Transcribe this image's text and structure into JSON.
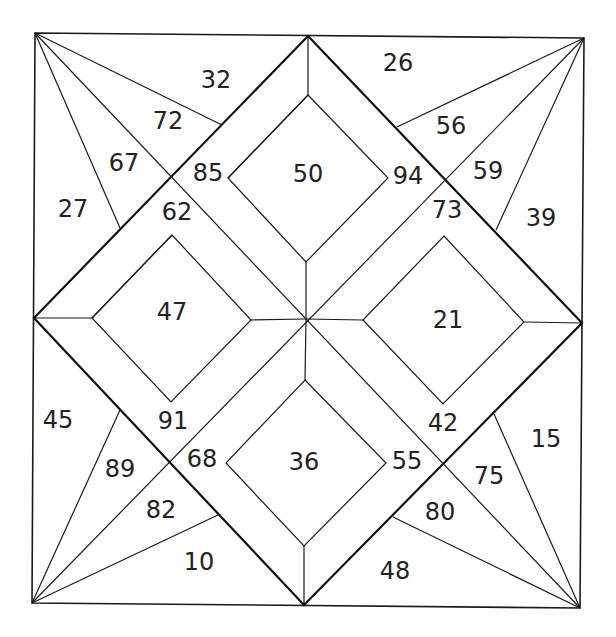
{
  "puzzle": {
    "type": "color-by-number quilt block",
    "colors": {
      "line": "#1a1a1a",
      "background": "#ffffff",
      "text": "#222222"
    },
    "regions": {
      "top_left_outer": "32",
      "top_left_fan_upper": "72",
      "top_left_fan_lower": "67",
      "top_left_side": "27",
      "top_right_outer": "26",
      "top_right_fan_upper": "56",
      "top_right_fan_lower": "59",
      "top_right_side": "39",
      "bottom_left_side": "45",
      "bottom_left_fan_upper": "89",
      "bottom_left_fan_lower": "82",
      "bottom_left_outer": "10",
      "bottom_right_side": "15",
      "bottom_right_fan_upper": "75",
      "bottom_right_fan_lower": "80",
      "bottom_right_outer": "48",
      "band_top_left_upper": "85",
      "band_top_left_lower": "62",
      "band_top_right_upper": "94",
      "band_top_right_lower": "73",
      "band_bottom_left_upper": "91",
      "band_bottom_left_lower": "68",
      "band_bottom_right_upper": "42",
      "band_bottom_right_lower": "55",
      "diamond_top": "50",
      "diamond_left": "47",
      "diamond_right": "21",
      "diamond_bottom": "36"
    }
  }
}
